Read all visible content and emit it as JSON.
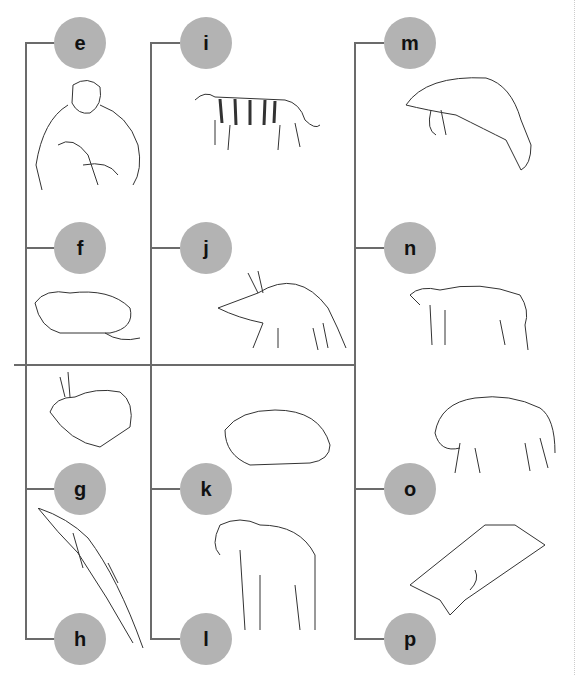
{
  "diagram": {
    "type": "cladogram-style grid of mammal illustrations",
    "nodes": [
      {
        "label": "e",
        "animal": "chimpanzee"
      },
      {
        "label": "f",
        "animal": "pika/rodent"
      },
      {
        "label": "g",
        "animal": "rabbit"
      },
      {
        "label": "h",
        "animal": "dolphin"
      },
      {
        "label": "i",
        "animal": "tiger"
      },
      {
        "label": "j",
        "animal": "aardvark"
      },
      {
        "label": "k",
        "animal": "hyrax"
      },
      {
        "label": "l",
        "animal": "elephant"
      },
      {
        "label": "m",
        "animal": "manatee"
      },
      {
        "label": "n",
        "animal": "tapir"
      },
      {
        "label": "o",
        "animal": "bison"
      },
      {
        "label": "p",
        "animal": "flying lemur"
      }
    ]
  }
}
